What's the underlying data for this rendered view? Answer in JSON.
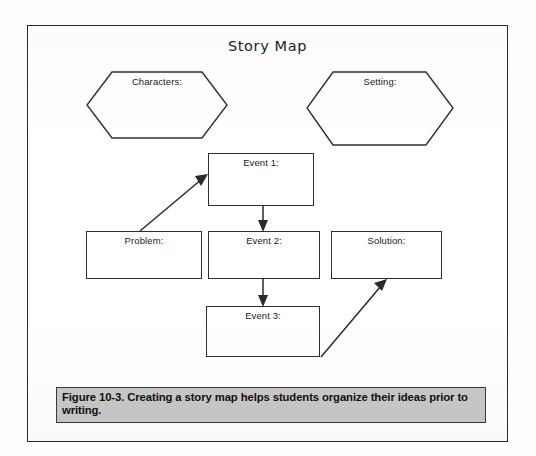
{
  "figure": {
    "title": "Story Map",
    "caption": "Figure 10-3. Creating a story map helps students organize their ideas prior to writing.",
    "caption_background": "#c8c8c8",
    "border_color": "#2a2a2a",
    "page_background": "#ffffff"
  },
  "nodes": {
    "characters": {
      "label": "Characters:",
      "shape": "hexagon"
    },
    "setting": {
      "label": "Setting:",
      "shape": "hexagon"
    },
    "event1": {
      "label": "Event 1:",
      "shape": "rectangle"
    },
    "problem": {
      "label": "Problem:",
      "shape": "rectangle"
    },
    "event2": {
      "label": "Event 2:",
      "shape": "rectangle"
    },
    "solution": {
      "label": "Solution:",
      "shape": "rectangle"
    },
    "event3": {
      "label": "Event 3:",
      "shape": "rectangle"
    }
  },
  "connectors": [
    {
      "name": "problem-to-event1",
      "from": "problem",
      "to": "event1",
      "style": "diagonal-arrow"
    },
    {
      "name": "event1-to-event2",
      "from": "event1",
      "to": "event2",
      "style": "vertical-arrow"
    },
    {
      "name": "event2-to-event3",
      "from": "event2",
      "to": "event3",
      "style": "vertical-arrow"
    },
    {
      "name": "event3-to-solution",
      "from": "event3",
      "to": "solution",
      "style": "diagonal-arrow"
    }
  ]
}
